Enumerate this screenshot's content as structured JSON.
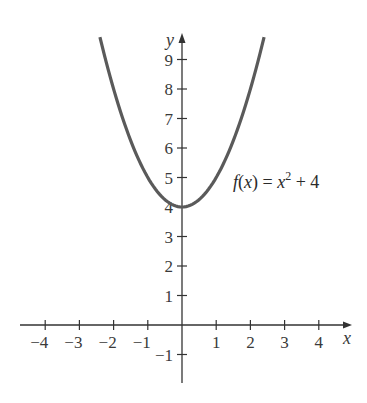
{
  "chart_data": {
    "type": "line",
    "title": "",
    "xlabel": "x",
    "ylabel": "y",
    "xlim": [
      -4.6,
      4.9
    ],
    "ylim": [
      -1.9,
      9.8
    ],
    "grid": false,
    "x_ticks": [
      -4,
      -3,
      -2,
      -1,
      1,
      2,
      3,
      4
    ],
    "y_ticks": [
      -1,
      1,
      2,
      3,
      4,
      5,
      6,
      7,
      8,
      9
    ],
    "series": [
      {
        "name": "f(x) = x^2 + 4",
        "expression": "x^2 + 4",
        "x_range": [
          -2.4,
          2.4
        ],
        "x": [
          -2.4,
          -2,
          -1.5,
          -1,
          -0.5,
          0,
          0.5,
          1,
          1.5,
          2,
          2.4
        ],
        "values": [
          9.76,
          8,
          6.25,
          5,
          4.25,
          4,
          4.25,
          5,
          6.25,
          8,
          9.76
        ],
        "color": "#5a5a5a"
      }
    ],
    "annotations": [
      {
        "text": "f(x) = x² + 4",
        "x": 1.4,
        "y": 4.9
      }
    ]
  },
  "labels": {
    "x_axis": "x",
    "y_axis": "y",
    "function": "f(x) = x² + 4",
    "function_prefix": "f(x) = x",
    "function_exp": "2",
    "function_suffix": " + 4",
    "x_ticks": [
      "−4",
      "−3",
      "−2",
      "−1",
      "1",
      "2",
      "3",
      "4"
    ],
    "y_ticks": [
      "9",
      "8",
      "7",
      "6",
      "5",
      "4",
      "3",
      "2",
      "1",
      "−1"
    ]
  },
  "colors": {
    "curve": "#5a5a5a",
    "axis": "#333333"
  }
}
